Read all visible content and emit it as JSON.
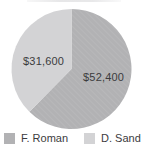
{
  "chart_data": {
    "type": "pie",
    "slices": [
      {
        "name": "F. Roman",
        "value": 52400,
        "label": "$52,400",
        "color": "#b2b2b4"
      },
      {
        "name": "D. Sand",
        "value": 31600,
        "label": "$31,600",
        "color": "#d3d3d5"
      }
    ],
    "start_angle_deg": 0,
    "direction": "clockwise",
    "legend_position": "bottom",
    "data_labels_shown": true,
    "label_color": "#3b3b3d",
    "background_color": "#ffffff"
  }
}
